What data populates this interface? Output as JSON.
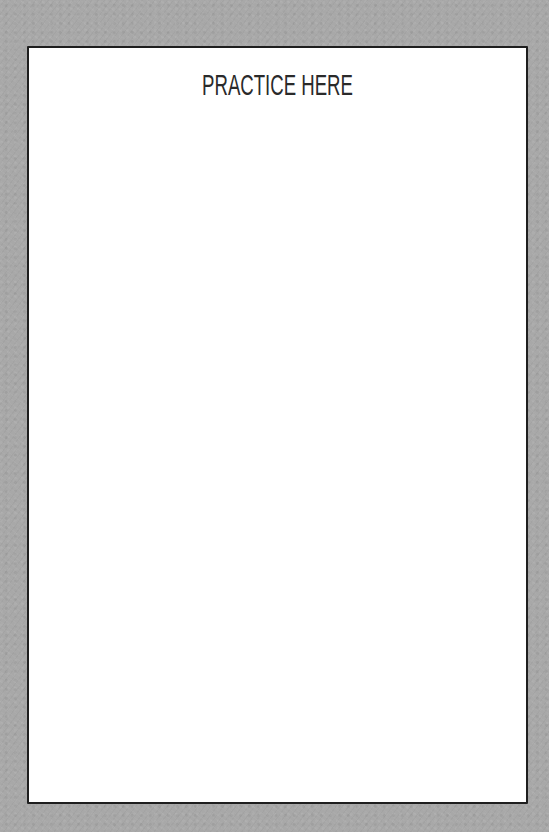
{
  "page": {
    "title": "PRACTICE HERE",
    "background_color": "#a8a8a8",
    "sheet_color": "#ffffff",
    "border_color": "#1e1e1e",
    "text_color": "#2a2a2a"
  }
}
